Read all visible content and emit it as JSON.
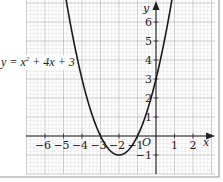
{
  "chart_data": {
    "type": "line",
    "title": "",
    "equation": "y = x² + 4x + 3",
    "equation_parts": {
      "lhs": "y = x",
      "exp": "2",
      "rhs": " + 4x + 3"
    },
    "xlabel": "x",
    "ylabel": "y",
    "origin_label": "O",
    "xlim": [
      -7.0,
      3.2
    ],
    "ylim": [
      -2.0,
      7.2
    ],
    "x_ticks": [
      -6,
      -5,
      -4,
      -3,
      -2,
      -1,
      1,
      2
    ],
    "x_tick_labels": [
      "−6",
      "−5",
      "−4",
      "−3",
      "−2",
      "−1",
      "1",
      "2"
    ],
    "y_ticks": [
      -1,
      1,
      2,
      3,
      4,
      5,
      6
    ],
    "y_tick_labels": [
      "−1",
      "1",
      "2",
      "3",
      "4",
      "5",
      "6"
    ],
    "grid": true,
    "grid_minor_step": 0.2,
    "series": [
      {
        "name": "y = x² + 4x + 3",
        "function": {
          "a": 1,
          "b": 4,
          "c": 3
        },
        "x_range": [
          -5.0,
          1.0
        ],
        "color": "#1a1a1a"
      }
    ],
    "key_points": [
      {
        "label": "root",
        "x": -3,
        "y": 0
      },
      {
        "label": "root",
        "x": -1,
        "y": 0
      },
      {
        "label": "vertex",
        "x": -2,
        "y": -1
      },
      {
        "label": "y-intercept",
        "x": 0,
        "y": 3
      }
    ]
  },
  "colors": {
    "grid_minor": "#d9d9d9",
    "grid_major": "#b5b5b5",
    "axis": "#222222",
    "curve": "#1a1a1a",
    "frame": "#9a9a9a"
  }
}
